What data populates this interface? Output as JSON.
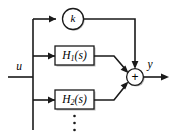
{
  "diagram": {
    "background_color": "#ffffff",
    "line_color": "#1a1a1a",
    "signals": {
      "input_label": "u",
      "output_label": "y"
    },
    "gain_block": {
      "label": "k",
      "shape": "circle",
      "name": "gain-k"
    },
    "transfer_blocks": [
      {
        "base": "H",
        "subscript": "1",
        "argument": "(s)",
        "full_label": "H1(s)",
        "name": "transfer-function-h1"
      },
      {
        "base": "H",
        "subscript": "2",
        "argument": "(s)",
        "full_label": "H2(s)",
        "name": "transfer-function-h2"
      }
    ],
    "summing_junction": {
      "sign": "+",
      "shape": "circle",
      "name": "summing-junction"
    },
    "continuation": {
      "symbol": "vertical-ellipsis",
      "dot_count": 3
    }
  }
}
